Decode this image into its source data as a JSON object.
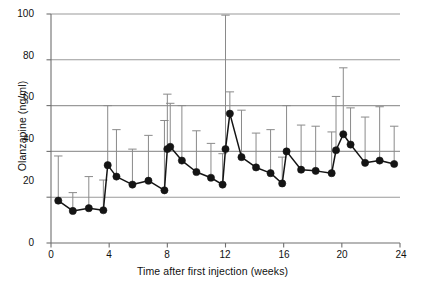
{
  "chart_data": {
    "type": "line",
    "title": "",
    "xlabel": "Time after first injection (weeks)",
    "ylabel": "Olanzapine (ng/ml)",
    "xlim": [
      0,
      24
    ],
    "ylim": [
      0,
      100
    ],
    "xticks": [
      0,
      4,
      8,
      12,
      16,
      20,
      24
    ],
    "yticks": [
      0,
      20,
      40,
      60,
      80,
      100
    ],
    "grid": "horizontal-gridlines-at-20-40-60-80-100",
    "legend": "none",
    "marker": "filled-circle",
    "errorbars": "upper-only-whisker-with-cap",
    "series": [
      {
        "name": "Olanzapine plasma concentration (mean with upper SD)",
        "x": [
          0.5,
          1.5,
          2.6,
          3.6,
          3.9,
          4.5,
          5.6,
          6.7,
          7.8,
          8.0,
          8.2,
          9.0,
          10.0,
          11.0,
          11.8,
          12.0,
          12.3,
          13.1,
          14.1,
          15.1,
          15.9,
          16.2,
          17.2,
          18.2,
          19.3,
          19.6,
          20.1,
          20.6,
          21.6,
          22.6,
          23.6
        ],
        "y": [
          18.5,
          14.0,
          15.2,
          14.3,
          34.0,
          29.0,
          25.5,
          27.2,
          23.0,
          41.0,
          42.0,
          36.0,
          31.0,
          28.5,
          25.5,
          41.0,
          56.5,
          37.5,
          33.0,
          30.5,
          26.0,
          40.0,
          32.0,
          31.5,
          30.5,
          40.5,
          47.5,
          43.0,
          35.0,
          36.0,
          34.5
        ],
        "yerr_upper": [
          38.0,
          22.0,
          29.0,
          27.5,
          60.0,
          49.5,
          41.0,
          47.0,
          53.5,
          65.0,
          61.0,
          60.0,
          49.0,
          43.5,
          39.0,
          99.5,
          66.0,
          58.0,
          48.0,
          49.5,
          37.5,
          60.0,
          51.5,
          51.0,
          48.5,
          64.0,
          76.5,
          59.0,
          55.0,
          59.5,
          51.0
        ]
      }
    ]
  },
  "axes": {
    "ytick_labels": [
      "0",
      "20",
      "40",
      "60",
      "80",
      "100"
    ],
    "xtick_labels": [
      "0",
      "4",
      "8",
      "12",
      "16",
      "20",
      "24"
    ],
    "y_axis_title": "Olanzapine (ng/ml)",
    "x_axis_title": "Time after first injection (weeks)"
  },
  "colors": {
    "marker": "#141414",
    "line": "#141414",
    "errorbar": "#8a8a8a",
    "gridline": "#9a9a9a",
    "axis": "#6f6f6f",
    "text": "#111111",
    "background": "#ffffff"
  }
}
